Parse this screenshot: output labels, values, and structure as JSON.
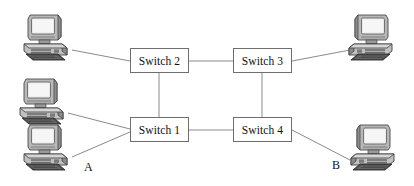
{
  "diagram": {
    "background_color": "#ffffff",
    "line_color": "#8a8a8a",
    "switch_border_color": "#6e6e6e",
    "text_color": "#111111",
    "switches": [
      {
        "id": "switch1",
        "label": "Switch 1",
        "x": 130,
        "y": 117,
        "width": 59,
        "height": 25
      },
      {
        "id": "switch2",
        "label": "Switch 2",
        "x": 130,
        "y": 48,
        "width": 59,
        "height": 25
      },
      {
        "id": "switch3",
        "label": "Switch 3",
        "x": 233,
        "y": 48,
        "width": 59,
        "height": 25
      },
      {
        "id": "switch4",
        "label": "Switch 4",
        "x": 233,
        "y": 117,
        "width": 59,
        "height": 25
      }
    ],
    "hosts": [
      {
        "id": "host-top-left",
        "label": "",
        "x": 18,
        "y": 12,
        "width": 56,
        "height": 50,
        "mirrored": false
      },
      {
        "id": "host-mid-left",
        "label": "",
        "x": 14,
        "y": 76,
        "width": 56,
        "height": 50,
        "mirrored": false
      },
      {
        "id": "host-bottom-left",
        "label": "A",
        "x": 18,
        "y": 122,
        "width": 56,
        "height": 50,
        "mirrored": false
      },
      {
        "id": "host-top-right",
        "label": "",
        "x": 342,
        "y": 12,
        "width": 56,
        "height": 50,
        "mirrored": true
      },
      {
        "id": "host-bottom-right",
        "label": "B",
        "x": 344,
        "y": 122,
        "width": 56,
        "height": 50,
        "mirrored": true
      }
    ],
    "host_labels": [
      {
        "id": "label-a",
        "text": "A",
        "x": 84,
        "y": 160
      },
      {
        "id": "label-b",
        "text": "B",
        "x": 332,
        "y": 158
      }
    ],
    "links": [
      {
        "id": "link-host-tl-switch2",
        "from": "host-top-left",
        "to": "switch2",
        "x1": 72,
        "y1": 50,
        "x2": 130,
        "y2": 61
      },
      {
        "id": "link-switch2-switch3",
        "from": "switch2",
        "to": "switch3",
        "x1": 189,
        "y1": 61,
        "x2": 233,
        "y2": 61
      },
      {
        "id": "link-switch3-host-tr",
        "from": "switch3",
        "to": "host-top-right",
        "x1": 292,
        "y1": 61,
        "x2": 350,
        "y2": 50
      },
      {
        "id": "link-switch2-switch1",
        "from": "switch2",
        "to": "switch1",
        "x1": 159,
        "y1": 73,
        "x2": 159,
        "y2": 117
      },
      {
        "id": "link-switch3-switch4",
        "from": "switch3",
        "to": "switch4",
        "x1": 262,
        "y1": 73,
        "x2": 262,
        "y2": 117
      },
      {
        "id": "link-host-ml-switch1",
        "from": "host-mid-left",
        "to": "switch1",
        "x1": 68,
        "y1": 113,
        "x2": 130,
        "y2": 129
      },
      {
        "id": "link-host-a-switch1",
        "from": "host-bottom-left",
        "to": "switch1",
        "x1": 72,
        "y1": 157,
        "x2": 130,
        "y2": 132
      },
      {
        "id": "link-switch1-switch4",
        "from": "switch1",
        "to": "switch4",
        "x1": 189,
        "y1": 130,
        "x2": 233,
        "y2": 130
      },
      {
        "id": "link-switch4-host-b",
        "from": "switch4",
        "to": "host-bottom-right",
        "x1": 292,
        "y1": 130,
        "x2": 350,
        "y2": 160
      }
    ]
  }
}
